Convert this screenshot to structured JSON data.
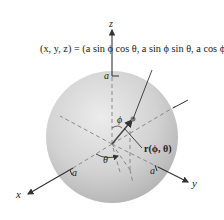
{
  "figure": {
    "equation": "(x, y, z) = (a sin ϕ cos θ, a sin ϕ sin θ, a cos ϕ)",
    "axes": {
      "x": "x",
      "y": "y",
      "z": "z"
    },
    "radius_label_top": "a",
    "radius_label_x": "a",
    "radius_label_y": "a",
    "phi_label": "ϕ",
    "theta_label": "θ",
    "vector_label": "r(ϕ, θ)",
    "colors": {
      "sphere_light": "#e6e6e6",
      "sphere_dark": "#b4b4b4",
      "axis": "#333333",
      "dashed": "#8a8a8a"
    }
  }
}
